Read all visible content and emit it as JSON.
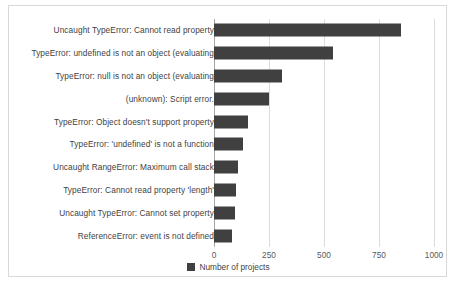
{
  "chart_data": {
    "type": "bar",
    "orientation": "horizontal",
    "title": "",
    "xlabel": "",
    "ylabel": "",
    "xlim": [
      0,
      1000
    ],
    "xticks": [
      0,
      250,
      500,
      750,
      1000
    ],
    "xtick_labels": [
      "0",
      "250",
      "500",
      "750",
      "1000"
    ],
    "grid": true,
    "legend_position": "bottom-center",
    "series": [
      {
        "name": "Number of projects",
        "color": "#404040",
        "values": [
          850,
          540,
          310,
          250,
          155,
          130,
          110,
          98,
          95,
          82
        ]
      }
    ],
    "categories": [
      "Uncaught TypeError: Cannot read property",
      "TypeError: undefined is not an object (evaluating",
      "TypeError: null is not an object (evaluating",
      "(unknown): Script error.",
      "TypeError: Object doesn't support property",
      "TypeError: 'undefined' is not a function",
      "Uncaught RangeError: Maximum call stack",
      "TypeError: Cannot read property 'length'",
      "Uncaught TypeError: Cannot set property",
      "ReferenceError: event is not defined"
    ]
  },
  "legend": {
    "label": "Number of projects",
    "swatch_color": "#404040"
  },
  "style": {
    "bar_color": "#404040",
    "grid_color": "#dcdcdc",
    "axis_color": "#a6a6a6",
    "frame_color": "#d9d9d9",
    "text_color": "#3f3f3f"
  }
}
